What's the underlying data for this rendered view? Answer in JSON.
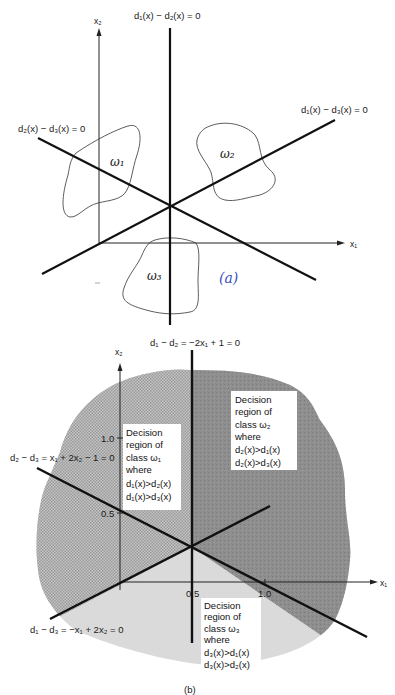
{
  "figure_a": {
    "axis_x_label": "x₁",
    "axis_y_label": "x₂",
    "boundaries": [
      {
        "label": "d₁(x) − d₂(x) = 0"
      },
      {
        "label": "d₁(x) − d₃(x) = 0"
      },
      {
        "label": "d₂(x) − d₃(x) = 0"
      }
    ],
    "classes": [
      {
        "label": "ω₁"
      },
      {
        "label": "ω₂"
      },
      {
        "label": "ω₃"
      }
    ],
    "handwritten_caption": "(a)"
  },
  "figure_b": {
    "axis_x_label": "x₁",
    "axis_y_label": "x₂",
    "x_ticks": [
      "0.5",
      "1.0"
    ],
    "y_ticks": [
      "0.5",
      "1.0"
    ],
    "boundaries": [
      {
        "label": "d₁ − d₂ = −2x₁ + 1 = 0"
      },
      {
        "label": "d₂ − d₃ = x₁ + 2x₂ − 1 = 0"
      },
      {
        "label": "d₁ − d₃ = −x₁ + 2x₂ = 0"
      }
    ],
    "regions": [
      {
        "lines": [
          "Decision",
          "region of",
          "class ω₁",
          "where",
          "d₁(x)>d₂(x)",
          "d₁(x)>d₃(x)"
        ]
      },
      {
        "lines": [
          "Decision",
          "region of",
          "class ω₂",
          "where",
          "d₂(x)>d₁(x)",
          "d₂(x)>d₃(x)"
        ]
      },
      {
        "lines": [
          "Decision",
          "region of",
          "class ω₃",
          "where",
          "d₃(x)>d₁(x)",
          "d₃(x)>d₂(x)"
        ]
      }
    ],
    "caption": "(b)",
    "colors": {
      "region1_hatch": "#b8b8b8",
      "region2_dark": "#8c8c8c",
      "region3_light": "#dcdcdc"
    }
  }
}
